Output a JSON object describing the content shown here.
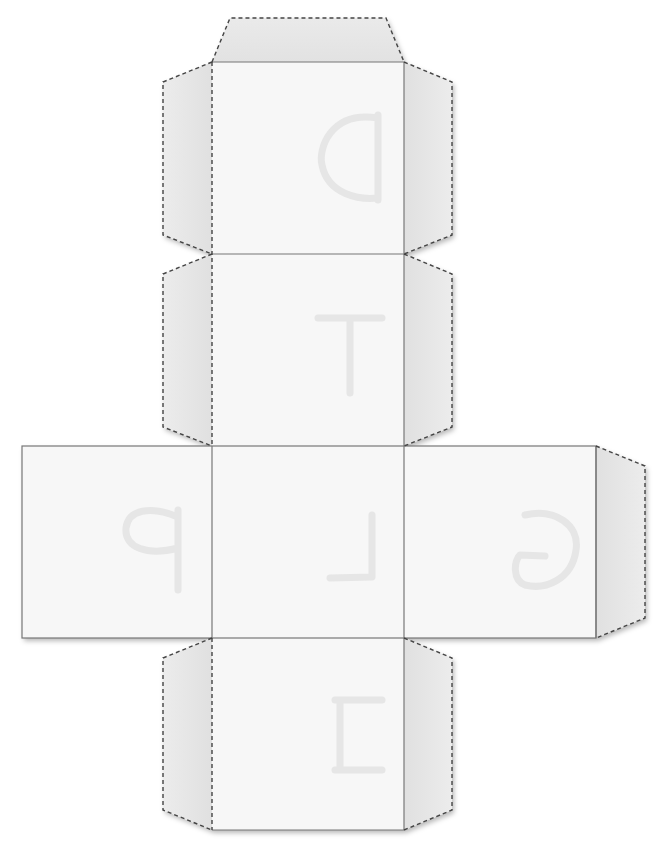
{
  "diagram": {
    "type": "cube-net",
    "colors": {
      "background": "#ffffff",
      "face_fill": "#f7f7f7",
      "tab_fill": "#e8e8e8",
      "face_edge": "#777777",
      "dashed_line": "#444444",
      "letter": "#e2e2e2"
    },
    "faces": [
      {
        "id": "top",
        "letter": "D",
        "rotation": 180
      },
      {
        "id": "upper-middle",
        "letter": "T",
        "rotation": 0
      },
      {
        "id": "middle-left",
        "letter": "P",
        "rotation": 90
      },
      {
        "id": "center",
        "letter": "L",
        "rotation": 270
      },
      {
        "id": "middle-right",
        "letter": "G",
        "rotation": 270
      },
      {
        "id": "bottom",
        "letter": "H",
        "rotation": 90
      }
    ],
    "tabs": [
      {
        "id": "tab-top"
      },
      {
        "id": "tab-top-face-left"
      },
      {
        "id": "tab-top-face-right"
      },
      {
        "id": "tab-upper-middle-left"
      },
      {
        "id": "tab-upper-middle-right"
      },
      {
        "id": "tab-middle-right-end"
      },
      {
        "id": "tab-bottom-left"
      },
      {
        "id": "tab-bottom-right"
      }
    ]
  }
}
